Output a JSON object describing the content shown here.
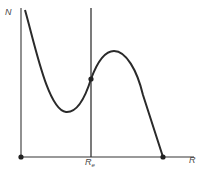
{
  "diagram": {
    "y_axis_label": "N",
    "x_axis_label": "R",
    "marker_label_main": "R",
    "marker_label_sub": "e",
    "colors": {
      "line": "#2a2a2a",
      "axis": "#555555",
      "background": "#ffffff"
    },
    "points": [
      {
        "name": "origin",
        "x": 21,
        "y": 157
      },
      {
        "name": "equilibrium",
        "x": 91,
        "y": 79
      },
      {
        "name": "x-intercept",
        "x": 163,
        "y": 157
      }
    ]
  }
}
